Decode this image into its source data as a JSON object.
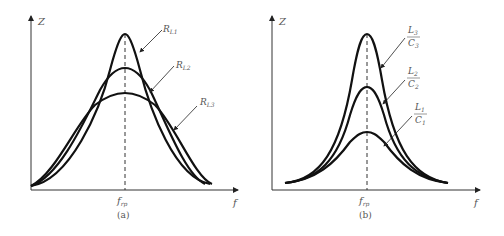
{
  "figure": {
    "panels": [
      {
        "id": "a",
        "caption": "(a)",
        "y_axis_label": "Z",
        "x_axis_label": "f",
        "center_label": "f",
        "center_sub": "rp",
        "curves": [
          {
            "label_main": "R",
            "label_sub": "L1",
            "peak": "highest, narrowest"
          },
          {
            "label_main": "R",
            "label_sub": "L2",
            "peak": "middle"
          },
          {
            "label_main": "R",
            "label_sub": "L3",
            "peak": "lowest, widest"
          }
        ]
      },
      {
        "id": "b",
        "caption": "(b)",
        "y_axis_label": "Z",
        "x_axis_label": "f",
        "center_label": "f",
        "center_sub": "rp",
        "curves": [
          {
            "num": "L",
            "num_sub": "3",
            "den": "C",
            "den_sub": "3",
            "peak": "highest"
          },
          {
            "num": "L",
            "num_sub": "2",
            "den": "C",
            "den_sub": "2",
            "peak": "middle"
          },
          {
            "num": "L",
            "num_sub": "1",
            "den": "C",
            "den_sub": "1",
            "peak": "lowest"
          }
        ]
      }
    ]
  }
}
